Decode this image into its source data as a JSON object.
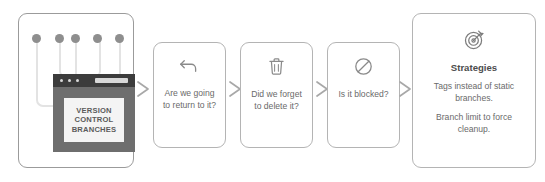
{
  "diagram": {
    "accent_color": "#8e8e8e",
    "border_color": "#b4b4b4",
    "text_color": "#6a6a6a"
  },
  "illustration": {
    "name": "version-control-branches-illustration",
    "screen_lines": [
      "VERSION",
      "CONTROL",
      "BRANCHES"
    ],
    "pin_count": 5
  },
  "cards": [
    {
      "icon": "undo-arrow-icon",
      "text": "Are we going to return to it?"
    },
    {
      "icon": "trash-icon",
      "text": "Did we forget to delete it?"
    },
    {
      "icon": "blocked-icon",
      "text": "Is it blocked?"
    }
  ],
  "strategies": {
    "icon": "target-icon",
    "title": "Strategies",
    "lines": [
      "Tags instead of static branches.",
      "Branch limit to force cleanup."
    ]
  },
  "arrows": {
    "glyph": "chevron-right",
    "count": 4
  }
}
